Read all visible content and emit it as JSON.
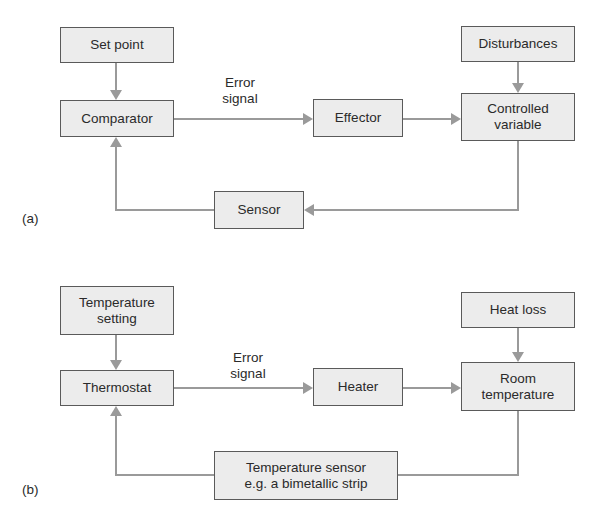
{
  "diagram_a": {
    "panel_label": "(a)",
    "boxes": {
      "set_point": "Set point",
      "comparator": "Comparator",
      "effector": "Effector",
      "disturbances": "Disturbances",
      "controlled_variable": "Controlled\nvariable",
      "sensor": "Sensor"
    },
    "edge_label": "Error\nsignal"
  },
  "diagram_b": {
    "panel_label": "(b)",
    "boxes": {
      "temperature_setting": "Temperature\nsetting",
      "thermostat": "Thermostat",
      "heater": "Heater",
      "heat_loss": "Heat loss",
      "room_temperature": "Room\ntemperature",
      "temperature_sensor": "Temperature sensor\ne.g. a bimetallic strip"
    },
    "edge_label": "Error\nsignal"
  },
  "colors": {
    "box_fill": "#ececec",
    "box_border": "#5a5a5a",
    "arrow": "#9a9a9a",
    "text": "#2a2a2a"
  }
}
